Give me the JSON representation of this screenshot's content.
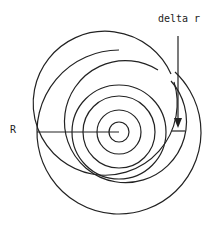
{
  "diagram": {
    "labels": {
      "radius": "R",
      "delta": "delta r"
    },
    "center": [
      119,
      132
    ],
    "radii": [
      82,
      72,
      61,
      47,
      36,
      22,
      10
    ],
    "stroke_color": "#222222"
  }
}
